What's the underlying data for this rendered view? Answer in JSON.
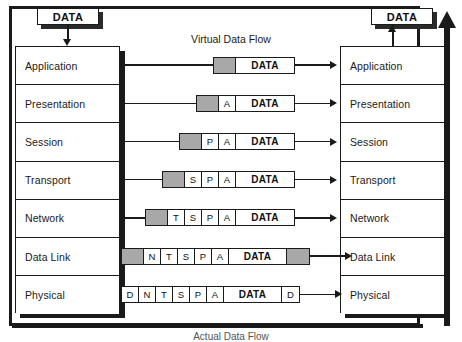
{
  "diagram": {
    "title": "Virtual Data Flow",
    "caption": "Actual Data Flow",
    "top_capsule_left": "DATA",
    "top_capsule_right": "DATA",
    "colors": {
      "line": "#1a1a1a",
      "header_gray": "#a8a8a8",
      "background": "#ffffff"
    },
    "layers_left": [
      {
        "label": "Application"
      },
      {
        "label": "Presentation"
      },
      {
        "label": "Session"
      },
      {
        "label": "Transport"
      },
      {
        "label": "Network"
      },
      {
        "label": "Data Link"
      },
      {
        "label": "Physical"
      }
    ],
    "layers_right": [
      {
        "label": "Application"
      },
      {
        "label": "Presentation"
      },
      {
        "label": "Session"
      },
      {
        "label": "Transport"
      },
      {
        "label": "Network"
      },
      {
        "label": "Data Link"
      },
      {
        "label": "Physical"
      }
    ],
    "packets": [
      {
        "layer": "Application",
        "cells": [
          {
            "text": "",
            "type": "gray",
            "w": 22
          },
          {
            "text": "DATA",
            "type": "data",
            "w": 58
          }
        ]
      },
      {
        "layer": "Presentation",
        "cells": [
          {
            "text": "",
            "type": "gray",
            "w": 22
          },
          {
            "text": "A",
            "type": "header",
            "w": 17
          },
          {
            "text": "DATA",
            "type": "data",
            "w": 58
          }
        ]
      },
      {
        "layer": "Session",
        "cells": [
          {
            "text": "",
            "type": "gray",
            "w": 22
          },
          {
            "text": "P",
            "type": "header",
            "w": 17
          },
          {
            "text": "A",
            "type": "header",
            "w": 17
          },
          {
            "text": "DATA",
            "type": "data",
            "w": 58
          }
        ]
      },
      {
        "layer": "Transport",
        "cells": [
          {
            "text": "",
            "type": "gray",
            "w": 22
          },
          {
            "text": "S",
            "type": "header",
            "w": 17
          },
          {
            "text": "P",
            "type": "header",
            "w": 17
          },
          {
            "text": "A",
            "type": "header",
            "w": 17
          },
          {
            "text": "DATA",
            "type": "data",
            "w": 58
          }
        ]
      },
      {
        "layer": "Network",
        "cells": [
          {
            "text": "",
            "type": "gray",
            "w": 22
          },
          {
            "text": "T",
            "type": "header",
            "w": 17
          },
          {
            "text": "S",
            "type": "header",
            "w": 17
          },
          {
            "text": "P",
            "type": "header",
            "w": 17
          },
          {
            "text": "A",
            "type": "header",
            "w": 17
          },
          {
            "text": "DATA",
            "type": "data",
            "w": 58
          }
        ]
      },
      {
        "layer": "Data Link",
        "cells": [
          {
            "text": "",
            "type": "gray",
            "w": 22
          },
          {
            "text": "N",
            "type": "header",
            "w": 17
          },
          {
            "text": "T",
            "type": "header",
            "w": 17
          },
          {
            "text": "S",
            "type": "header",
            "w": 17
          },
          {
            "text": "P",
            "type": "header",
            "w": 17
          },
          {
            "text": "A",
            "type": "header",
            "w": 17
          },
          {
            "text": "DATA",
            "type": "data",
            "w": 58
          },
          {
            "text": "",
            "type": "gray",
            "w": 22
          }
        ]
      },
      {
        "layer": "Physical",
        "cells": [
          {
            "text": "D",
            "type": "header",
            "w": 17
          },
          {
            "text": "N",
            "type": "header",
            "w": 17
          },
          {
            "text": "T",
            "type": "header",
            "w": 17
          },
          {
            "text": "S",
            "type": "header",
            "w": 17
          },
          {
            "text": "P",
            "type": "header",
            "w": 17
          },
          {
            "text": "A",
            "type": "header",
            "w": 17
          },
          {
            "text": "DATA",
            "type": "data",
            "w": 58
          },
          {
            "text": "D",
            "type": "header",
            "w": 17
          }
        ]
      }
    ]
  }
}
